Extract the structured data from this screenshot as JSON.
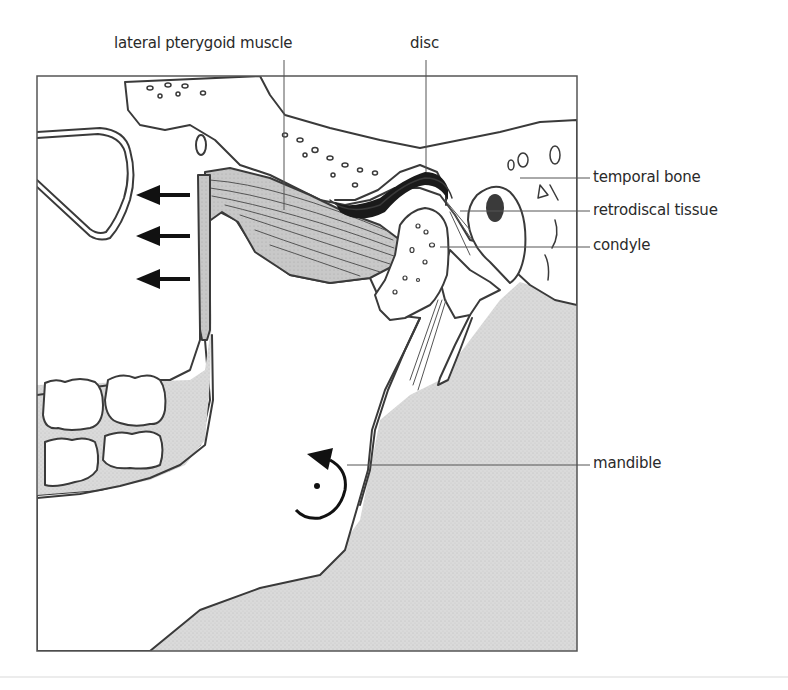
{
  "figure": {
    "colors": {
      "line": "#3a3a3a",
      "stipple": "#d9d9d9",
      "muscle": "#c9c9c9",
      "disc": "#1a1a1a",
      "arrow": "#111111",
      "background": "#ffffff"
    },
    "labels": {
      "lateral_pterygoid_muscle": "lateral pterygoid muscle",
      "disc": "disc",
      "temporal_bone": "temporal bone",
      "retrodiscal_tissue": "retrodiscal tissue",
      "condyle": "condyle",
      "mandible": "mandible"
    },
    "annotations": {
      "pull_arrows": {
        "count": 3,
        "direction": "left"
      },
      "rotation_arrow": {
        "direction": "counterclockwise"
      }
    }
  }
}
